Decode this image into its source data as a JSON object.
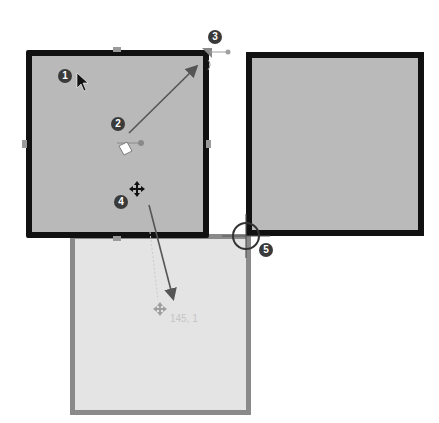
{
  "diagram": {
    "shapes": [
      {
        "id": "selected-square",
        "state": "selected",
        "fill": "#b9b9b9",
        "border": "#111111"
      },
      {
        "id": "target-square",
        "state": "normal",
        "fill": "#bababa",
        "border": "#111111"
      },
      {
        "id": "ghost-square",
        "state": "drag-preview",
        "fill": "#e4e4e4",
        "border": "#8a8a8a"
      }
    ],
    "callouts": [
      {
        "number": "1",
        "meaning": "mouse pointer on selected shape"
      },
      {
        "number": "2",
        "meaning": "rotation handle"
      },
      {
        "number": "3",
        "meaning": "corner resize handle"
      },
      {
        "number": "4",
        "meaning": "move cursor"
      },
      {
        "number": "5",
        "meaning": "snap point"
      }
    ],
    "drag_coordinate_label": "145, 1",
    "colors": {
      "badge": "#3a3a3a",
      "arrow": "#555555",
      "snap_ring": "#333333",
      "handle": "#9a9a9a"
    }
  }
}
